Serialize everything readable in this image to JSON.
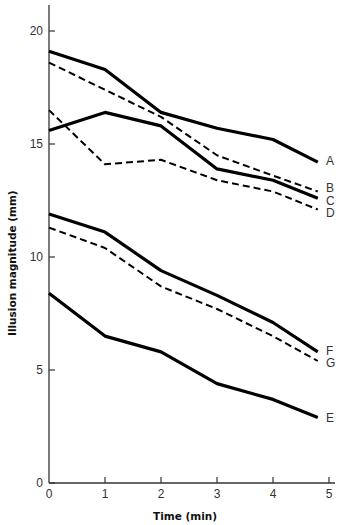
{
  "chart_data": {
    "type": "line",
    "title": "",
    "xlabel": "Time (min)",
    "ylabel": "Illusion magnitude (mm)",
    "xlim": [
      0,
      5
    ],
    "ylim": [
      0,
      21
    ],
    "grid": false,
    "legend": "inline labels at line ends (right)",
    "x_ticks": [
      0,
      1,
      2,
      3,
      4,
      5
    ],
    "y_ticks": [
      0,
      5,
      10,
      15,
      20
    ],
    "x": [
      0,
      1,
      2,
      3,
      4,
      4.8
    ],
    "series": [
      {
        "name": "A",
        "style": "solid-thick",
        "values": [
          19.1,
          18.3,
          16.4,
          15.7,
          15.2,
          14.2
        ]
      },
      {
        "name": "B",
        "style": "dashed",
        "values": [
          18.6,
          17.4,
          16.2,
          14.5,
          13.6,
          12.9
        ]
      },
      {
        "name": "C",
        "style": "solid-thick",
        "values": [
          15.6,
          16.4,
          15.8,
          13.9,
          13.4,
          12.6
        ]
      },
      {
        "name": "D",
        "style": "dashed",
        "values": [
          16.5,
          14.1,
          14.3,
          13.4,
          12.9,
          12.1
        ]
      },
      {
        "name": "E",
        "style": "solid-thick",
        "values": [
          8.4,
          6.5,
          5.8,
          4.4,
          3.7,
          2.9
        ]
      },
      {
        "name": "F",
        "style": "solid-thick",
        "values": [
          11.9,
          11.1,
          9.4,
          8.3,
          7.1,
          5.8
        ]
      },
      {
        "name": "G",
        "style": "dashed",
        "values": [
          11.3,
          10.4,
          8.7,
          7.7,
          6.5,
          5.4
        ]
      }
    ]
  },
  "axes": {
    "x_title": "Time (min)",
    "y_title": "Illusion magnitude (mm)"
  }
}
